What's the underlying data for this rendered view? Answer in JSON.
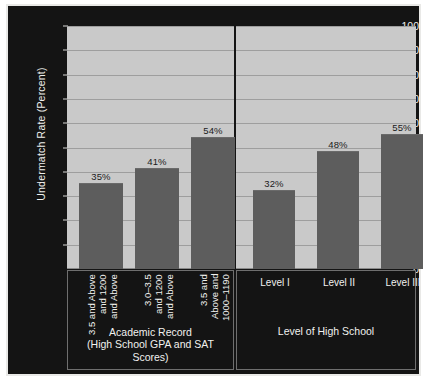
{
  "chart_data": {
    "type": "bar",
    "title": "",
    "xlabel": "",
    "ylabel": "Undermatch Rate (Percent)",
    "ylim": [
      0,
      100
    ],
    "ytick_labels": [
      "100",
      "90",
      "80",
      "70",
      "60",
      "50",
      "40",
      "30",
      "20",
      "10",
      "0"
    ],
    "ytick_values": [
      100,
      90,
      80,
      70,
      60,
      50,
      40,
      30,
      20,
      10,
      0
    ],
    "grid": true,
    "legend": "none",
    "groups": [
      {
        "name": "Academic Record",
        "caption_line1": "Academic Record",
        "caption_line2": "(High School GPA and SAT Scores)",
        "categories": [
          "3.5 and Above\nand 1200\nand Above",
          "3.0–3.5\nand 1200\nand Above",
          "3.5 and\nAbove and\n1000–1190"
        ],
        "values": [
          35,
          41,
          54
        ],
        "value_labels": [
          "35%",
          "41%",
          "54%"
        ]
      },
      {
        "name": "Level of High School",
        "caption_line1": "Level of High School",
        "caption_line2": "",
        "categories": [
          "Level I",
          "Level II",
          "Level III"
        ],
        "values": [
          32,
          48,
          55
        ],
        "value_labels": [
          "32%",
          "48%",
          "55%"
        ]
      }
    ],
    "colors": {
      "background": "#141414",
      "plot_area": "#c9c9c9",
      "bar": "#5d5d5d",
      "gridline": "#9e9e9e",
      "axis_text": "#efefed",
      "bar_label_text": "#1b1b1b"
    }
  }
}
